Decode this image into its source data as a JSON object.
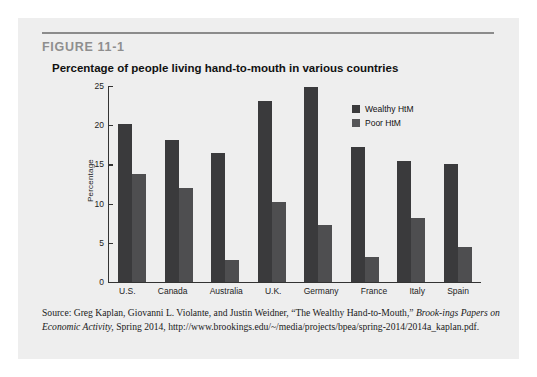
{
  "figure": {
    "number": "FIGURE 11-1",
    "title": "Percentage of people living hand-to-mouth in various countries"
  },
  "source": {
    "line1_prefix": "Source: Greg Kaplan, Giovanni L. Violante, and Justin Weidner, “The Wealthy Hand-to-Mouth,” ",
    "line1_italic": "Brook-",
    "line2_italic": "ings Papers on Economic Activity,",
    "line2_rest": " Spring 2014, http://www.brookings.edu/~/media/projects/bpea/spring-",
    "line3": "2014/2014a_kaplan.pdf."
  },
  "chart_data": {
    "type": "bar",
    "title": "Percentage of people living hand-to-mouth in various countries",
    "xlabel": "",
    "ylabel": "Percentage",
    "ylim": [
      0,
      25
    ],
    "yticks": [
      0,
      5,
      10,
      15,
      20,
      25
    ],
    "grid": false,
    "legend_position": "top-right",
    "categories": [
      "U.S.",
      "Canada",
      "Australia",
      "U.K.",
      "Germany",
      "France",
      "Italy",
      "Spain"
    ],
    "series": [
      {
        "name": "Wealthy HtM",
        "color": "#3a3a3c",
        "values": [
          20.2,
          18.1,
          16.4,
          23.1,
          24.9,
          17.2,
          15.4,
          15.1
        ]
      },
      {
        "name": "Poor HtM",
        "color": "#4e4e50",
        "values": [
          13.8,
          12.0,
          2.8,
          10.2,
          7.3,
          3.2,
          8.2,
          4.5
        ]
      }
    ]
  }
}
